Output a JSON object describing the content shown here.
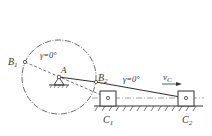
{
  "diagram": {
    "type": "crank-slider mechanism (limit positions)",
    "colors": {
      "line": "#333333",
      "background": "#ffffff"
    },
    "labels": {
      "B1": {
        "main": "B",
        "sub": "1"
      },
      "B2": {
        "main": "B",
        "sub": "2"
      },
      "A": "A",
      "gamma_left": "γ=0°",
      "gamma_right": "γ=0°",
      "vc": {
        "main": "v",
        "sub": "C"
      },
      "C1": {
        "main": "C",
        "sub": "1"
      },
      "C2": {
        "main": "C",
        "sub": "2"
      }
    },
    "points": {
      "A": [
        59,
        77
      ],
      "B1": [
        25,
        62
      ],
      "B2": [
        96,
        82
      ],
      "C1": [
        108,
        98
      ],
      "C2": [
        186,
        98
      ]
    },
    "crank_circle_radius": 37
  }
}
